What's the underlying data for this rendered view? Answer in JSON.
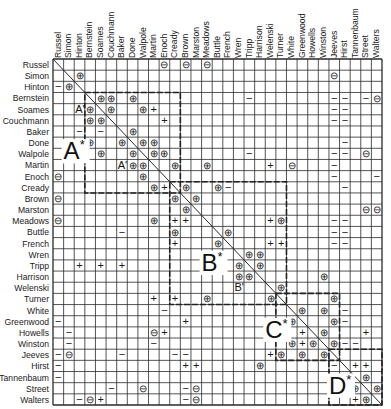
{
  "matrix": {
    "names": [
      "Russel",
      "Simon",
      "Hinton",
      "Bernstein",
      "Soames",
      "Couchmann",
      "Baker",
      "Done",
      "Walpole",
      "Martin",
      "Enoch",
      "Cready",
      "Brown",
      "Marston",
      "Meadows",
      "Buttle",
      "French",
      "Wren",
      "Tripp",
      "Harrison",
      "Welenski",
      "Turner",
      "White",
      "Greenwood",
      "Howells",
      "Winston",
      "Jeeves",
      "Hirst",
      "Tannenbaum",
      "Street",
      "Walters"
    ],
    "legend_symbols": {
      "strong_positive": "⊕",
      "positive": "+",
      "strong_negative": "⊖",
      "negative": "−"
    },
    "block_labels": [
      {
        "label": "A*",
        "row": 8,
        "col": 1
      },
      {
        "label": "B*",
        "row": 18,
        "col": 14
      },
      {
        "label": "C*",
        "row": 24,
        "col": 20
      },
      {
        "label": "D*",
        "row": 29,
        "col": 26
      }
    ],
    "sub_labels": [
      {
        "label": "A'",
        "row": 4,
        "col": 2
      },
      {
        "label": "A'",
        "row": 9,
        "col": 6
      },
      {
        "label": "B'",
        "row": 20,
        "col": 17
      }
    ],
    "cells": [
      [
        0,
        10,
        "⊖"
      ],
      [
        0,
        12,
        "⊖"
      ],
      [
        0,
        14,
        "⊖"
      ],
      [
        1,
        2,
        "⊕"
      ],
      [
        1,
        26,
        "⊖"
      ],
      [
        2,
        0,
        "−"
      ],
      [
        2,
        1,
        "⊕"
      ],
      [
        3,
        4,
        "⊕"
      ],
      [
        3,
        5,
        "⊕"
      ],
      [
        3,
        7,
        "⊕"
      ],
      [
        3,
        18,
        "−"
      ],
      [
        3,
        26,
        "−"
      ],
      [
        3,
        27,
        "−"
      ],
      [
        3,
        29,
        "−"
      ],
      [
        3,
        30,
        "⊖"
      ],
      [
        4,
        3,
        "⊕"
      ],
      [
        4,
        5,
        "⊕"
      ],
      [
        4,
        8,
        "⊕"
      ],
      [
        4,
        9,
        "+"
      ],
      [
        4,
        26,
        "−"
      ],
      [
        4,
        27,
        "−"
      ],
      [
        5,
        3,
        "⊕"
      ],
      [
        5,
        4,
        "⊕"
      ],
      [
        5,
        10,
        "+"
      ],
      [
        5,
        26,
        "−"
      ],
      [
        5,
        27,
        "−"
      ],
      [
        6,
        2,
        "−"
      ],
      [
        6,
        4,
        "−"
      ],
      [
        6,
        7,
        "⊕"
      ],
      [
        7,
        3,
        "⊕"
      ],
      [
        7,
        6,
        "⊕"
      ],
      [
        7,
        8,
        "⊕"
      ],
      [
        7,
        9,
        "⊕"
      ],
      [
        7,
        27,
        "−"
      ],
      [
        8,
        4,
        "⊕"
      ],
      [
        8,
        7,
        "⊕"
      ],
      [
        8,
        9,
        "⊕"
      ],
      [
        8,
        10,
        "⊕"
      ],
      [
        8,
        18,
        "−"
      ],
      [
        8,
        26,
        "−"
      ],
      [
        8,
        27,
        "−"
      ],
      [
        8,
        29,
        "⊖"
      ],
      [
        9,
        7,
        "⊕"
      ],
      [
        9,
        8,
        "⊕"
      ],
      [
        9,
        11,
        "⊕"
      ],
      [
        9,
        14,
        "⊕"
      ],
      [
        9,
        20,
        "+"
      ],
      [
        9,
        22,
        "⊖"
      ],
      [
        9,
        26,
        "−"
      ],
      [
        10,
        0,
        "⊖"
      ],
      [
        10,
        8,
        "⊕"
      ],
      [
        10,
        26,
        "−"
      ],
      [
        10,
        30,
        "−"
      ],
      [
        11,
        9,
        "⊕"
      ],
      [
        11,
        10,
        "+"
      ],
      [
        11,
        12,
        "⊕"
      ],
      [
        11,
        15,
        "⊕"
      ],
      [
        11,
        16,
        "−"
      ],
      [
        11,
        27,
        "−"
      ],
      [
        12,
        0,
        "⊖"
      ],
      [
        12,
        11,
        "⊕"
      ],
      [
        12,
        13,
        "⊕"
      ],
      [
        13,
        12,
        "⊕"
      ],
      [
        13,
        29,
        "⊖"
      ],
      [
        13,
        30,
        "⊖"
      ],
      [
        14,
        0,
        "⊖"
      ],
      [
        14,
        9,
        "⊕"
      ],
      [
        14,
        11,
        "+"
      ],
      [
        14,
        12,
        "+"
      ],
      [
        14,
        20,
        "+"
      ],
      [
        14,
        21,
        "⊕"
      ],
      [
        14,
        26,
        "−"
      ],
      [
        14,
        27,
        "−"
      ],
      [
        15,
        6,
        "−"
      ],
      [
        15,
        11,
        "⊕"
      ],
      [
        15,
        16,
        "⊕"
      ],
      [
        15,
        26,
        "−"
      ],
      [
        15,
        27,
        "−"
      ],
      [
        16,
        11,
        "+"
      ],
      [
        16,
        15,
        "⊕"
      ],
      [
        16,
        20,
        "+"
      ],
      [
        16,
        21,
        "+"
      ],
      [
        16,
        26,
        "−"
      ],
      [
        16,
        27,
        "−"
      ],
      [
        17,
        18,
        "⊕"
      ],
      [
        17,
        19,
        "⊕"
      ],
      [
        18,
        2,
        "+"
      ],
      [
        18,
        4,
        "+"
      ],
      [
        18,
        6,
        "+"
      ],
      [
        18,
        17,
        "⊕"
      ],
      [
        18,
        19,
        "⊕"
      ],
      [
        19,
        17,
        "⊕"
      ],
      [
        19,
        18,
        "⊕"
      ],
      [
        19,
        25,
        "⊕"
      ],
      [
        20,
        21,
        "⊕"
      ],
      [
        21,
        9,
        "+"
      ],
      [
        21,
        11,
        "+"
      ],
      [
        21,
        14,
        "⊕"
      ],
      [
        21,
        20,
        "⊕"
      ],
      [
        21,
        26,
        "⊕"
      ],
      [
        22,
        10,
        "−"
      ],
      [
        22,
        23,
        "⊕"
      ],
      [
        22,
        25,
        "⊕"
      ],
      [
        22,
        27,
        "−"
      ],
      [
        23,
        0,
        "−"
      ],
      [
        23,
        12,
        "+"
      ],
      [
        23,
        22,
        "⊕"
      ],
      [
        23,
        26,
        "⊕"
      ],
      [
        23,
        27,
        "−"
      ],
      [
        24,
        1,
        "−"
      ],
      [
        24,
        9,
        "⊖"
      ],
      [
        24,
        10,
        "+"
      ],
      [
        24,
        23,
        "+"
      ],
      [
        24,
        25,
        "⊕"
      ],
      [
        24,
        29,
        "+"
      ],
      [
        25,
        1,
        "−"
      ],
      [
        25,
        9,
        "−"
      ],
      [
        25,
        22,
        "⊕"
      ],
      [
        25,
        23,
        "+"
      ],
      [
        25,
        24,
        "⊕"
      ],
      [
        25,
        26,
        "⊕"
      ],
      [
        25,
        27,
        "−"
      ],
      [
        25,
        28,
        "−"
      ],
      [
        26,
        0,
        "−"
      ],
      [
        26,
        1,
        "⊖"
      ],
      [
        26,
        6,
        "−"
      ],
      [
        26,
        11,
        "−"
      ],
      [
        26,
        12,
        "−"
      ],
      [
        26,
        20,
        "+"
      ],
      [
        26,
        21,
        "⊕"
      ],
      [
        26,
        23,
        "⊕"
      ],
      [
        26,
        25,
        "⊕"
      ],
      [
        27,
        0,
        "−"
      ],
      [
        27,
        12,
        "+"
      ],
      [
        27,
        13,
        "+"
      ],
      [
        27,
        19,
        "⊕"
      ],
      [
        27,
        26,
        "−"
      ],
      [
        27,
        28,
        "+"
      ],
      [
        27,
        29,
        "+"
      ],
      [
        28,
        0,
        "−"
      ],
      [
        28,
        29,
        "⊕"
      ],
      [
        29,
        5,
        "−"
      ],
      [
        29,
        8,
        "⊖"
      ],
      [
        29,
        12,
        "−"
      ],
      [
        29,
        13,
        "⊖"
      ],
      [
        29,
        28,
        "⊕"
      ],
      [
        29,
        30,
        "⊕"
      ],
      [
        30,
        2,
        "−"
      ],
      [
        30,
        3,
        "⊖"
      ],
      [
        30,
        4,
        "+"
      ],
      [
        30,
        12,
        "−"
      ],
      [
        30,
        13,
        "⊖"
      ],
      [
        30,
        28,
        "+"
      ],
      [
        30,
        29,
        "⊕"
      ]
    ]
  }
}
